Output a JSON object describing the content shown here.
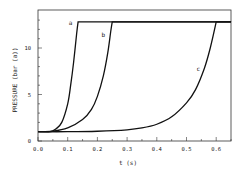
{
  "chart_data": {
    "type": "line",
    "title": "",
    "xlabel": "t (s)",
    "ylabel": "PRESSURE (bar (a))",
    "xlim": [
      0.0,
      0.65
    ],
    "ylim": [
      0,
      13.5
    ],
    "xticks": [
      0.0,
      0.1,
      0.2,
      0.3,
      0.4,
      0.5,
      0.6
    ],
    "xtick_labels": [
      "0.0",
      "0.1",
      "0.2",
      "0.3",
      "0.4",
      "0.5",
      "0.6"
    ],
    "yticks": [
      0,
      5,
      10
    ],
    "ytick_labels": [
      "0",
      "5",
      "10"
    ],
    "grid": false,
    "legend": "none (curves labeled inline)",
    "series": [
      {
        "name": "a",
        "x": [
          0.0,
          0.04,
          0.06,
          0.08,
          0.1,
          0.11,
          0.12,
          0.13,
          0.135,
          0.65
        ],
        "y": [
          1.0,
          1.0,
          1.3,
          2.0,
          4.0,
          6.0,
          8.5,
          11.5,
          12.8,
          12.8
        ]
      },
      {
        "name": "b",
        "x": [
          0.0,
          0.05,
          0.1,
          0.15,
          0.18,
          0.2,
          0.22,
          0.235,
          0.245,
          0.25,
          0.65
        ],
        "y": [
          1.0,
          1.05,
          1.4,
          2.3,
          3.4,
          4.8,
          7.0,
          9.5,
          11.8,
          12.8,
          12.8
        ]
      },
      {
        "name": "c",
        "x": [
          0.0,
          0.1,
          0.2,
          0.3,
          0.35,
          0.4,
          0.45,
          0.5,
          0.53,
          0.56,
          0.58,
          0.6,
          0.65
        ],
        "y": [
          1.0,
          1.0,
          1.05,
          1.2,
          1.4,
          1.8,
          2.6,
          4.1,
          5.5,
          7.8,
          10.0,
          12.8,
          12.8
        ]
      }
    ],
    "annotations": [
      {
        "text": "a",
        "x": 0.11,
        "y": 12.5
      },
      {
        "text": "b",
        "x": 0.22,
        "y": 11.2
      },
      {
        "text": "c",
        "x": 0.54,
        "y": 7.5
      }
    ]
  }
}
